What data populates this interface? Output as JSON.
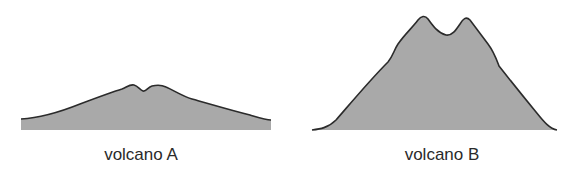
{
  "figure": {
    "fill_color": "#a9a9a9",
    "outline_color": "#2b2b2b",
    "volcanoes": [
      {
        "id": "A",
        "label": "volcano A",
        "shape": "broad, low-profile (shield-like) with two small summit bumps"
      },
      {
        "id": "B",
        "label": "volcano B",
        "shape": "tall, steep-sided (composite-like) with twin summit peaks"
      }
    ]
  }
}
